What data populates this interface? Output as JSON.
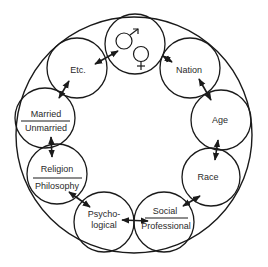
{
  "diagram": {
    "title": "",
    "outer_circle": {
      "cx": 134,
      "cy": 135,
      "rx": 118,
      "ry": 118
    },
    "center_node": {
      "label": "gender-symbols",
      "cx": 135,
      "cy": 44,
      "r": 30
    },
    "nodes": [
      {
        "id": "etc",
        "cx": 77,
        "cy": 68,
        "r": 30,
        "lines": [
          "Etc."
        ],
        "divided": false
      },
      {
        "id": "nation",
        "cx": 190,
        "cy": 68,
        "r": 30,
        "lines": [
          "Nation"
        ],
        "divided": false
      },
      {
        "id": "married",
        "cx": 45,
        "cy": 118,
        "r": 30,
        "lines": [
          "Married",
          "Unmarried"
        ],
        "divided": true
      },
      {
        "id": "age",
        "cx": 221,
        "cy": 120,
        "r": 30,
        "lines": [
          "Age"
        ],
        "divided": false
      },
      {
        "id": "religion",
        "cx": 57,
        "cy": 174,
        "r": 30,
        "lines": [
          "Religion",
          "Philosophy"
        ],
        "divided": true
      },
      {
        "id": "race",
        "cx": 211,
        "cy": 177,
        "r": 29,
        "lines": [
          "Race"
        ],
        "divided": false
      },
      {
        "id": "psychological",
        "cx": 104,
        "cy": 222,
        "r": 30,
        "lines": [
          "Psycho-",
          "logical"
        ],
        "divided": false
      },
      {
        "id": "social",
        "cx": 164,
        "cy": 222,
        "r": 30,
        "lines": [
          "Social",
          "Professional"
        ],
        "divided": true
      }
    ],
    "connections": [
      [
        "gender",
        "etc"
      ],
      [
        "gender",
        "nation"
      ],
      [
        "etc",
        "married"
      ],
      [
        "nation",
        "age"
      ],
      [
        "married",
        "religion"
      ],
      [
        "age",
        "race"
      ],
      [
        "religion",
        "psychological"
      ],
      [
        "race",
        "social"
      ],
      [
        "psychological",
        "social"
      ]
    ],
    "colors": {
      "stroke": "#1a1a1a",
      "text": "#2a2a2a",
      "background": "#ffffff"
    }
  },
  "labels": {
    "etc": "Etc.",
    "nation": "Nation",
    "married": "Married",
    "unmarried": "Unmarried",
    "age": "Age",
    "religion": "Religion",
    "philosophy": "Philosophy",
    "race": "Race",
    "psycho": "Psycho-",
    "logical": "logical",
    "social": "Social",
    "professional": "Professional"
  }
}
